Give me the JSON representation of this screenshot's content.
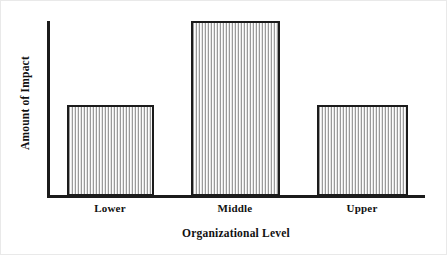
{
  "chart_data": {
    "type": "bar",
    "title": "",
    "subtitle": "",
    "xlabel": "Organizational Level",
    "ylabel": "Amount of Impact",
    "categories": [
      "Lower",
      "Middle",
      "Upper"
    ],
    "values": [
      52,
      100,
      52
    ],
    "ylim": [
      0,
      100
    ],
    "xlim": null,
    "grid": false,
    "legend": null,
    "legend_position": "none",
    "annotations": [],
    "axis_ticks": {
      "x": [
        "Lower",
        "Middle",
        "Upper"
      ],
      "y": []
    },
    "series": [
      {
        "name": "Amount of Impact",
        "values": [
          52,
          100,
          52
        ]
      }
    ],
    "style": {
      "bar_fill": "#f2f2f2",
      "bar_hatch": "vertical-lines",
      "bar_hatch_color": "#9a9a9a",
      "bar_border": "#1b1b1b",
      "axis_color": "#1b1b1b",
      "background": "#ffffff",
      "text_color": "#111111"
    }
  },
  "axes": {
    "x_title": "Organizational Level",
    "y_title": "Amount of Impact"
  },
  "bars": [
    {
      "label": "Lower",
      "value": 52
    },
    {
      "label": "Middle",
      "value": 100
    },
    {
      "label": "Upper",
      "value": 52
    }
  ]
}
